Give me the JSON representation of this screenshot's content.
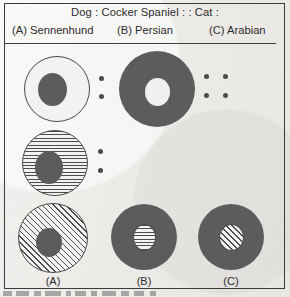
{
  "question": {
    "stem": "Dog : Cocker Spaniel : : Cat :",
    "options": [
      {
        "key": "(A)",
        "label": "(A) Sennenhund"
      },
      {
        "key": "(B)",
        "label": "(B) Persian"
      },
      {
        "key": "(C)",
        "label": "(C) Arabian"
      }
    ]
  },
  "figure": {
    "row1": {
      "left_shape": "outline-circle-with-solid-inner-circle",
      "separator": "colon-two-dots",
      "right_shape": "solid-donut-with-white-center",
      "separator2": "four-dots-proportion"
    },
    "row2": {
      "left_shape": "horizontally-striped-circle-with-solid-inner-circle",
      "separator": "colon-two-dots"
    },
    "row3": {
      "a_shape": "diagonally-hatched-circle-with-solid-inner-circle",
      "b_shape": "solid-circle-with-horizontally-striped-inner",
      "c_shape": "solid-circle-with-diagonally-hatched-inner"
    },
    "labels": {
      "a": "(A)",
      "b": "(B)",
      "c": "(C)"
    }
  },
  "colors": {
    "paper": "#efedeb",
    "ink": "#2b2b2b",
    "fill_dark": "#5c5c5c",
    "stroke": "#4a4a4a"
  }
}
